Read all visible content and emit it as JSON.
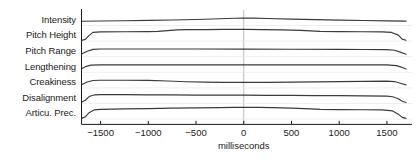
{
  "chart_data": {
    "type": "line",
    "title": "",
    "subtitle": "",
    "xlabel": "milliseconds",
    "ylabel": "",
    "xlim": [
      -1700,
      1700
    ],
    "xticks": [
      -1500,
      -1000,
      -500,
      0,
      500,
      1000,
      1500
    ],
    "xtick_labels": [
      "−1500",
      "−1000",
      "−500",
      "0",
      "500",
      "1000",
      "1500"
    ],
    "grid": false,
    "legend_position": "none",
    "reference_line_x": 0,
    "panel_layout": "stacked-strips",
    "panel_count": 7,
    "line_color": "#3a3a3a",
    "axis_color": "#1a1a1a",
    "reference_line_color": "#aaaaaa",
    "panels": [
      {
        "label": "Intensity",
        "x": [
          -1700,
          -1500,
          -1250,
          -1000,
          -750,
          -500,
          -250,
          -100,
          0,
          100,
          250,
          500,
          750,
          1000,
          1250,
          1500,
          1700
        ],
        "values": [
          0.3,
          0.32,
          0.34,
          0.37,
          0.4,
          0.44,
          0.5,
          0.54,
          0.56,
          0.55,
          0.52,
          0.47,
          0.43,
          0.39,
          0.36,
          0.33,
          0.31
        ]
      },
      {
        "label": "Pitch Height",
        "x": [
          -1700,
          -1660,
          -1620,
          -1580,
          -1500,
          -1250,
          -1000,
          -900,
          -800,
          -700,
          -600,
          -400,
          -200,
          0,
          200,
          400,
          600,
          700,
          800,
          1000,
          1250,
          1450,
          1550,
          1620,
          1660,
          1700
        ],
        "values": [
          0.02,
          0.1,
          0.42,
          0.66,
          0.7,
          0.71,
          0.72,
          0.74,
          0.8,
          0.86,
          0.88,
          0.89,
          0.9,
          0.9,
          0.89,
          0.86,
          0.82,
          0.78,
          0.74,
          0.72,
          0.71,
          0.7,
          0.66,
          0.44,
          0.12,
          0.03
        ]
      },
      {
        "label": "Pitch Range",
        "x": [
          -1700,
          -1640,
          -1580,
          -1500,
          -1250,
          -1000,
          -500,
          0,
          500,
          1000,
          1250,
          1500,
          1580,
          1640,
          1700
        ],
        "values": [
          0.18,
          0.4,
          0.55,
          0.58,
          0.58,
          0.58,
          0.58,
          0.57,
          0.56,
          0.55,
          0.54,
          0.53,
          0.48,
          0.33,
          0.16
        ]
      },
      {
        "label": "Lengthening",
        "x": [
          -1700,
          -1650,
          -1600,
          -1500,
          -1250,
          -1000,
          -500,
          0,
          500,
          1000,
          1250,
          1500,
          1600,
          1650,
          1700
        ],
        "values": [
          0.24,
          0.44,
          0.54,
          0.56,
          0.56,
          0.56,
          0.56,
          0.56,
          0.56,
          0.56,
          0.56,
          0.56,
          0.5,
          0.38,
          0.22
        ]
      },
      {
        "label": "Creakiness",
        "x": [
          -1700,
          -1640,
          -1580,
          -1500,
          -1250,
          -1000,
          -800,
          -600,
          -400,
          -200,
          0,
          250,
          500,
          750,
          1000,
          1250,
          1500,
          1580,
          1640,
          1700
        ],
        "values": [
          0.22,
          0.44,
          0.56,
          0.58,
          0.58,
          0.57,
          0.52,
          0.46,
          0.42,
          0.4,
          0.4,
          0.41,
          0.43,
          0.45,
          0.47,
          0.49,
          0.51,
          0.47,
          0.34,
          0.2
        ]
      },
      {
        "label": "Disalignment",
        "x": [
          -1700,
          -1660,
          -1620,
          -1560,
          -1500,
          -1250,
          -1000,
          -750,
          -500,
          -250,
          0,
          250,
          500,
          750,
          1000,
          1250,
          1500,
          1560,
          1620,
          1660,
          1700
        ],
        "values": [
          0.06,
          0.22,
          0.52,
          0.66,
          0.68,
          0.67,
          0.66,
          0.65,
          0.64,
          0.63,
          0.63,
          0.62,
          0.61,
          0.6,
          0.59,
          0.58,
          0.56,
          0.5,
          0.34,
          0.14,
          0.04
        ]
      },
      {
        "label": "Articu. Prec.",
        "x": [
          -1700,
          -1660,
          -1620,
          -1570,
          -1500,
          -1250,
          -1000,
          -750,
          -500,
          -250,
          -100,
          0,
          150,
          300,
          500,
          700,
          800,
          1000,
          1250,
          1450,
          1560,
          1620,
          1660,
          1700
        ],
        "values": [
          0.02,
          0.14,
          0.48,
          0.7,
          0.74,
          0.78,
          0.81,
          0.84,
          0.87,
          0.89,
          0.9,
          0.9,
          0.9,
          0.88,
          0.84,
          0.78,
          0.74,
          0.72,
          0.71,
          0.7,
          0.62,
          0.36,
          0.1,
          0.02
        ]
      }
    ]
  }
}
